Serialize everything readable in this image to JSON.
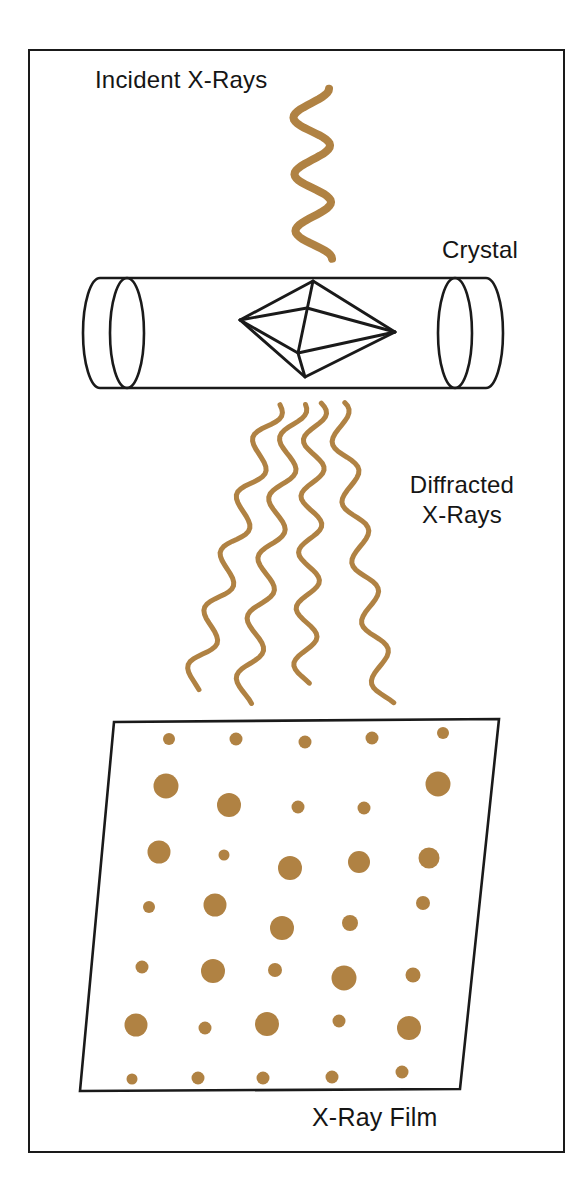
{
  "diagram": {
    "labels": {
      "incident": "Incident X-Rays",
      "crystal": "Crystal",
      "diffracted_line1": "Diffracted",
      "diffracted_line2": "X-Rays",
      "film": "X-Ray Film"
    },
    "colors": {
      "xray": "#b08243",
      "ink": "#1a1a1a",
      "background": "#ffffff"
    },
    "waves": {
      "incident": {
        "x1": 311,
        "y1": 89,
        "x2": 314,
        "y2": 259,
        "amplitude": 18,
        "cycles": 3,
        "phase": 1.5708,
        "width": 8
      },
      "diffracted": [
        {
          "x1": 274,
          "y1": 403,
          "x2": 193,
          "y2": 688,
          "amplitude": 11,
          "cycles": 5,
          "phase": 0.6,
          "width": 5
        },
        {
          "x1": 297,
          "y1": 403,
          "x2": 243,
          "y2": 702,
          "amplitude": 11,
          "cycles": 5,
          "phase": 0.9,
          "width": 5
        },
        {
          "x1": 316,
          "y1": 403,
          "x2": 304,
          "y2": 683,
          "amplitude": 11,
          "cycles": 5,
          "phase": 0.5,
          "width": 5
        },
        {
          "x1": 337,
          "y1": 404,
          "x2": 386,
          "y2": 704,
          "amplitude": 11,
          "cycles": 5,
          "phase": 0.8,
          "width": 5
        }
      ]
    },
    "film_spots": [
      {
        "x": 169,
        "y": 739,
        "r": 6
      },
      {
        "x": 236,
        "y": 739,
        "r": 6.5
      },
      {
        "x": 305,
        "y": 742,
        "r": 6.5
      },
      {
        "x": 372,
        "y": 738,
        "r": 6.5
      },
      {
        "x": 443,
        "y": 733,
        "r": 6
      },
      {
        "x": 166,
        "y": 786,
        "r": 12.5
      },
      {
        "x": 229,
        "y": 805,
        "r": 12
      },
      {
        "x": 298,
        "y": 807,
        "r": 6.5
      },
      {
        "x": 364,
        "y": 808,
        "r": 6.5
      },
      {
        "x": 438,
        "y": 784,
        "r": 12.5
      },
      {
        "x": 159,
        "y": 852,
        "r": 11.5
      },
      {
        "x": 224,
        "y": 855,
        "r": 5.5
      },
      {
        "x": 290,
        "y": 868,
        "r": 12
      },
      {
        "x": 359,
        "y": 862,
        "r": 11
      },
      {
        "x": 429,
        "y": 858,
        "r": 10.5
      },
      {
        "x": 149,
        "y": 907,
        "r": 6
      },
      {
        "x": 215,
        "y": 905,
        "r": 11.5
      },
      {
        "x": 282,
        "y": 928,
        "r": 12
      },
      {
        "x": 350,
        "y": 923,
        "r": 8
      },
      {
        "x": 423,
        "y": 903,
        "r": 7
      },
      {
        "x": 142,
        "y": 967,
        "r": 6.5
      },
      {
        "x": 213,
        "y": 971,
        "r": 12
      },
      {
        "x": 275,
        "y": 970,
        "r": 7
      },
      {
        "x": 344,
        "y": 978,
        "r": 12.5
      },
      {
        "x": 413,
        "y": 975,
        "r": 7.5
      },
      {
        "x": 136,
        "y": 1025,
        "r": 11.5
      },
      {
        "x": 205,
        "y": 1028,
        "r": 6.5
      },
      {
        "x": 267,
        "y": 1024,
        "r": 12
      },
      {
        "x": 339,
        "y": 1021,
        "r": 6.5
      },
      {
        "x": 409,
        "y": 1028,
        "r": 12
      },
      {
        "x": 132,
        "y": 1079,
        "r": 5.5
      },
      {
        "x": 198,
        "y": 1078,
        "r": 6.5
      },
      {
        "x": 263,
        "y": 1078,
        "r": 6.5
      },
      {
        "x": 332,
        "y": 1077,
        "r": 6.5
      },
      {
        "x": 402,
        "y": 1072,
        "r": 6.5
      }
    ]
  }
}
